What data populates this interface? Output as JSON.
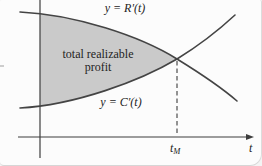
{
  "figure": {
    "curve_labels": {
      "revenue": "y = R′(t)",
      "cost": "y = C′(t)"
    },
    "region_label": {
      "line1": "total realizable",
      "line2": "profit"
    },
    "axis": {
      "x_label": "t",
      "intersection_tick_base": "t",
      "intersection_tick_sub": "M"
    }
  },
  "colors": {
    "region_fill": "#cacaca",
    "curve_stroke": "#444444",
    "axis_stroke": "#3d3d3d",
    "dash_stroke": "#5a5a5a",
    "text_color": "#242424",
    "bg_color": "#fcfcfc"
  }
}
